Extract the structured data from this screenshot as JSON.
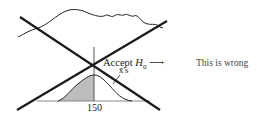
{
  "diagram": {
    "accept_label_prefix": "Accept ",
    "accept_symbol": "H",
    "accept_subscript": "0",
    "arrow": "⟶",
    "curve_label": "x̄'s",
    "axis_tick": "150",
    "annotation": "This is wrong",
    "colors": {
      "ink": "#222222",
      "shade": "#bdbdbd",
      "cross": "#1a1a1a"
    }
  }
}
